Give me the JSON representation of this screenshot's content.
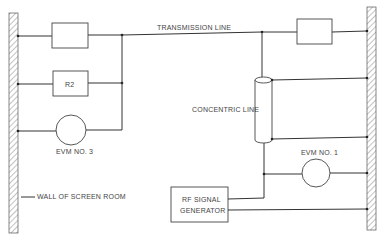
{
  "diagram": {
    "type": "circuit-schematic",
    "labels": {
      "transmission_line": "TRANSMISSION LINE",
      "r2": "R2",
      "concentric_line": "CONCENTRIC LINE",
      "evm3": "EVM NO. 3",
      "evm1": "EVM NO. 1",
      "wall": "WALL OF SCREEN ROOM",
      "rf_gen_line1": "RF SIGNAL",
      "rf_gen_line2": "GENERATOR"
    },
    "components": [
      {
        "id": "resistor-top-left",
        "type": "resistor",
        "label": ""
      },
      {
        "id": "resistor-r2",
        "type": "resistor",
        "label": "R2"
      },
      {
        "id": "evm-3",
        "type": "meter",
        "label": "EVM NO. 3"
      },
      {
        "id": "resistor-top-right",
        "type": "resistor",
        "label": ""
      },
      {
        "id": "concentric-line",
        "type": "coaxial",
        "label": "CONCENTRIC LINE"
      },
      {
        "id": "evm-1",
        "type": "meter",
        "label": "EVM NO. 1"
      },
      {
        "id": "rf-signal-generator",
        "type": "source",
        "label": "RF SIGNAL GENERATOR"
      },
      {
        "id": "wall-left",
        "type": "wall",
        "label": "WALL OF SCREEN ROOM"
      },
      {
        "id": "wall-right",
        "type": "wall",
        "label": ""
      }
    ],
    "colors": {
      "line": "#333333",
      "background": "#ffffff",
      "text": "#444444"
    }
  }
}
